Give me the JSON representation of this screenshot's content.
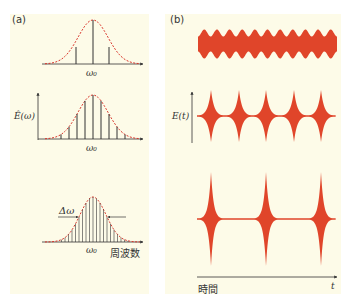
{
  "panel_a": {
    "label": "(a)",
    "ylabel": "Ê(ω)",
    "center_label": "ω₀",
    "width_label": "Δω",
    "xlabel": "周波数",
    "spectra": [
      {
        "name": "3 modes",
        "line_offsets": [
          -17,
          0,
          16
        ],
        "spacing_px": 16.5
      },
      {
        "name": "7 modes",
        "spacing_px": 8
      },
      {
        "name": "many modes",
        "spacing_px": 3.5
      }
    ]
  },
  "panel_b": {
    "label": "(b)",
    "ylabel": "E(t)",
    "xlabel": "時間",
    "t_label": "t",
    "waveforms": [
      {
        "name": "3-mode beat",
        "bulges": 11
      },
      {
        "name": "7-mode pulses",
        "pulses": 5
      },
      {
        "name": "many-mode pulses",
        "pulses": 3
      }
    ]
  },
  "colors": {
    "background": "#fdfbe8",
    "waveform": "#e0452a",
    "envelope": "#d9342a",
    "axis": "#333333"
  }
}
